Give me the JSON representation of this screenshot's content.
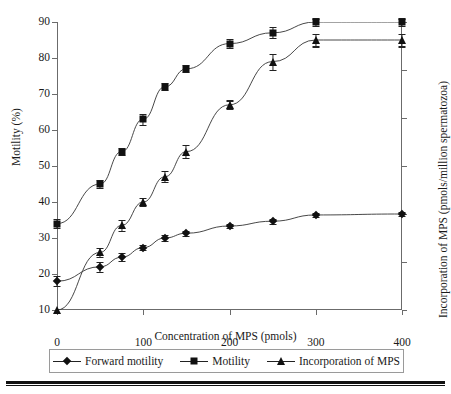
{
  "chart_data": {
    "type": "line",
    "title": "",
    "xlabel": "Concentration of MPS (pmols)",
    "ylabel": "Motility (%)",
    "y2label": "Incorporation of MPS (pmols/million spermatozoa)",
    "xlim": [
      0,
      400
    ],
    "ylim": [
      10,
      90
    ],
    "y2lim": [
      0,
      6
    ],
    "xticks": [
      0,
      100,
      200,
      300,
      400
    ],
    "yticks": [
      10,
      20,
      30,
      40,
      50,
      60,
      70,
      80,
      90
    ],
    "y2ticks": [
      0,
      1,
      2,
      3,
      4,
      5,
      6
    ],
    "grid": false,
    "legend_position": "bottom",
    "series": [
      {
        "name": "Forward motility",
        "marker": "diamond",
        "axis": "right",
        "x": [
          0,
          50,
          75,
          100,
          125,
          150,
          200,
          250,
          300,
          400
        ],
        "values": [
          0.6,
          0.9,
          1.1,
          1.3,
          1.5,
          1.6,
          1.75,
          1.85,
          1.98,
          2.0
        ],
        "errors": [
          0.1,
          0.1,
          0.08,
          0.05,
          0.06,
          0.05,
          0.05,
          0.05,
          0.05,
          0.05
        ]
      },
      {
        "name": "Motility",
        "marker": "square",
        "axis": "left",
        "x": [
          0,
          50,
          75,
          100,
          125,
          150,
          200,
          250,
          300,
          400
        ],
        "values": [
          34,
          45,
          54,
          63,
          72,
          77,
          84,
          87,
          90,
          90
        ],
        "errors": [
          1.2,
          1.0,
          1.0,
          1.5,
          1.0,
          1.0,
          1.2,
          1.5,
          1.0,
          1.0
        ]
      },
      {
        "name": "Incorporation of MPS",
        "marker": "triangle",
        "axis": "left",
        "x": [
          0,
          50,
          75,
          100,
          125,
          150,
          200,
          250,
          300,
          400
        ],
        "values": [
          10,
          26,
          33.5,
          40,
          47,
          54,
          67,
          79,
          85,
          85
        ],
        "errors": [
          0,
          1.2,
          1.5,
          1.0,
          1.5,
          1.8,
          1.2,
          2.2,
          1.8,
          1.8
        ]
      }
    ]
  },
  "axes": {
    "left": {
      "title": "Motility (%)",
      "ticks": [
        "90",
        "80",
        "70",
        "60",
        "50",
        "40",
        "30",
        "20",
        "10"
      ]
    },
    "right": {
      "title": "Incorporation of MPS (pmols/million spermatozoa)",
      "ticks": [
        "6",
        "5",
        "4",
        "3",
        "2",
        "1",
        "0"
      ]
    },
    "bottom": {
      "title": "Concentration of MPS (pmols)",
      "ticks": [
        "0",
        "100",
        "200",
        "300",
        "400"
      ]
    }
  },
  "legend": {
    "items": [
      {
        "label": "Forward motility",
        "marker": "diamond-marker"
      },
      {
        "label": "Motility",
        "marker": "square-marker"
      },
      {
        "label": "Incorporation of MPS",
        "marker": "triangle-marker"
      }
    ]
  },
  "colors": {
    "ink": "#111111",
    "axis": "#6b6b6b",
    "background": "#ffffff"
  }
}
